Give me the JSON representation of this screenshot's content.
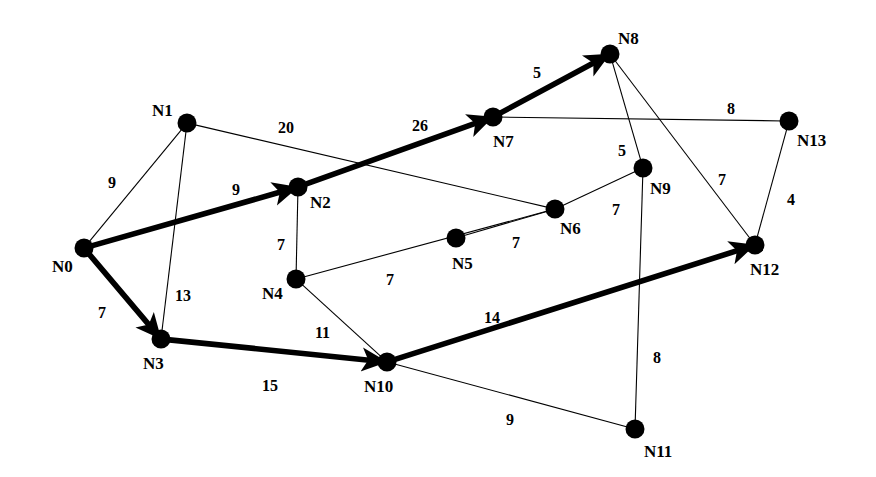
{
  "diagram": {
    "canvas": {
      "width": 876,
      "height": 477
    },
    "colors": {
      "background": "#ffffff",
      "stroke": "#000000",
      "node_fill": "#000000",
      "highlight": "#000000"
    },
    "nodes": [
      {
        "id": "N0",
        "label": "N0",
        "x": 84,
        "y": 248,
        "r": 9.5,
        "label_x": 52,
        "label_y": 258
      },
      {
        "id": "N1",
        "label": "N1",
        "x": 187,
        "y": 123,
        "r": 9.5,
        "label_x": 152,
        "label_y": 102
      },
      {
        "id": "N2",
        "label": "N2",
        "x": 298,
        "y": 187,
        "r": 9.5,
        "label_x": 310,
        "label_y": 194
      },
      {
        "id": "N3",
        "label": "N3",
        "x": 161,
        "y": 339,
        "r": 9.5,
        "label_x": 143,
        "label_y": 355
      },
      {
        "id": "N4",
        "label": "N4",
        "x": 296,
        "y": 279,
        "r": 9.5,
        "label_x": 262,
        "label_y": 285
      },
      {
        "id": "N5",
        "label": "N5",
        "x": 456,
        "y": 238,
        "r": 9.5,
        "label_x": 452,
        "label_y": 255
      },
      {
        "id": "N6",
        "label": "N6",
        "x": 555,
        "y": 209,
        "r": 9.5,
        "label_x": 560,
        "label_y": 220
      },
      {
        "id": "N7",
        "label": "N7",
        "x": 493,
        "y": 117,
        "r": 9.5,
        "label_x": 493,
        "label_y": 133
      },
      {
        "id": "N8",
        "label": "N8",
        "x": 610,
        "y": 54,
        "r": 9.5,
        "label_x": 618,
        "label_y": 30
      },
      {
        "id": "N9",
        "label": "N9",
        "x": 643,
        "y": 168,
        "r": 9.5,
        "label_x": 650,
        "label_y": 180
      },
      {
        "id": "N10",
        "label": "N10",
        "x": 387,
        "y": 362,
        "r": 9.5,
        "label_x": 364,
        "label_y": 378
      },
      {
        "id": "N11",
        "label": "N11",
        "x": 635,
        "y": 429,
        "r": 9.5,
        "label_x": 644,
        "label_y": 443
      },
      {
        "id": "N12",
        "label": "N12",
        "x": 755,
        "y": 245,
        "r": 9.5,
        "label_x": 750,
        "label_y": 261
      },
      {
        "id": "N13",
        "label": "N13",
        "x": 789,
        "y": 121,
        "r": 9.5,
        "label_x": 797,
        "label_y": 132
      }
    ],
    "edges": [
      {
        "from": "N0",
        "to": "N1",
        "weight": "9",
        "style": "thin",
        "directed": false,
        "label_x": 108,
        "label_y": 175
      },
      {
        "from": "N1",
        "to": "N3",
        "weight": "13",
        "style": "thin",
        "directed": false,
        "label_x": 175,
        "label_y": 288
      },
      {
        "from": "N1",
        "to": "N6",
        "weight": "20",
        "style": "thin",
        "directed": false,
        "label_x": 278,
        "label_y": 120
      },
      {
        "from": "N0",
        "to": "N2",
        "weight": "9",
        "style": "thick",
        "directed": true,
        "label_x": 232,
        "label_y": 182
      },
      {
        "from": "N0",
        "to": "N3",
        "weight": "7",
        "style": "thick",
        "directed": true,
        "label_x": 98,
        "label_y": 305
      },
      {
        "from": "N2",
        "to": "N7",
        "weight": "26",
        "style": "thick",
        "directed": true,
        "label_x": 412,
        "label_y": 118
      },
      {
        "from": "N2",
        "to": "N4",
        "weight": "7",
        "style": "thin",
        "directed": false,
        "label_x": 277,
        "label_y": 237
      },
      {
        "from": "N7",
        "to": "N8",
        "weight": "5",
        "style": "thick",
        "directed": true,
        "label_x": 533,
        "label_y": 65
      },
      {
        "from": "N7",
        "to": "N13",
        "weight": "8",
        "style": "thin",
        "directed": false,
        "label_x": 727,
        "label_y": 101
      },
      {
        "from": "N8",
        "to": "N9",
        "weight": "5",
        "style": "thin",
        "directed": false,
        "label_x": 618,
        "label_y": 143
      },
      {
        "from": "N8",
        "to": "N12",
        "weight": "7",
        "style": "thin",
        "directed": false,
        "label_x": 718,
        "label_y": 172
      },
      {
        "from": "N4",
        "to": "N6",
        "weight": "7",
        "style": "thin",
        "directed": false,
        "label_x": 386,
        "label_y": 272
      },
      {
        "from": "N5",
        "to": "N6",
        "weight": "7",
        "style": "thin",
        "directed": false,
        "label_x": 512,
        "label_y": 235
      },
      {
        "from": "N6",
        "to": "N9",
        "weight": "7",
        "style": "thin",
        "directed": false,
        "label_x": 612,
        "label_y": 202
      },
      {
        "from": "N4",
        "to": "N10",
        "weight": "11",
        "style": "thin",
        "directed": false,
        "label_x": 315,
        "label_y": 325
      },
      {
        "from": "N3",
        "to": "N10",
        "weight": "15",
        "style": "thick",
        "directed": true,
        "label_x": 262,
        "label_y": 378
      },
      {
        "from": "N10",
        "to": "N12",
        "weight": "14",
        "style": "thick",
        "directed": true,
        "label_x": 484,
        "label_y": 310
      },
      {
        "from": "N10",
        "to": "N11",
        "weight": "9",
        "style": "thin",
        "directed": false,
        "label_x": 506,
        "label_y": 412
      },
      {
        "from": "N9",
        "to": "N11",
        "weight": "8",
        "style": "thin",
        "directed": false,
        "label_x": 653,
        "label_y": 350
      },
      {
        "from": "N12",
        "to": "N13",
        "weight": "4",
        "style": "thin",
        "directed": false,
        "label_x": 787,
        "label_y": 192
      }
    ]
  }
}
